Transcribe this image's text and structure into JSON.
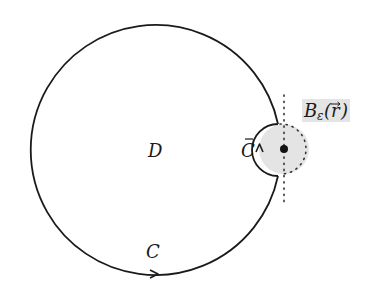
{
  "diagram": {
    "colors": {
      "stroke": "#1a1a1a",
      "ball_fill": "#e4e4e4",
      "label_bg": "#e4e4e4",
      "background": "#ffffff"
    },
    "big_circle": {
      "cx": 155,
      "cy": 150,
      "r": 125
    },
    "small_ball": {
      "cx": 284,
      "cy": 149,
      "r": 25
    },
    "labels": {
      "region": "D",
      "curve": "C",
      "inner_arc_base": "C",
      "inner_arc_bar": "¯",
      "ball_main": "B",
      "ball_sub": "ε",
      "ball_open": "(",
      "ball_arg": "r",
      "ball_vec": "→",
      "ball_close": ")"
    }
  }
}
